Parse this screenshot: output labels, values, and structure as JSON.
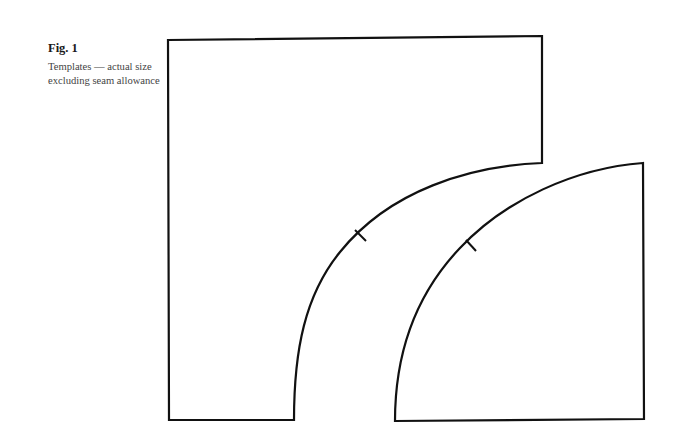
{
  "caption": {
    "label": "Fig. 1",
    "description": "Templates — actual size excluding seam allowance"
  },
  "templates": [
    {
      "name": "outer-template",
      "path": "M168,40 L542,36 L542,163 C470,166 390,190 340,252 C305,295 294,350 294,420 L169,420 Z",
      "notch": {
        "x1": 355,
        "y1": 230,
        "x2": 366,
        "y2": 241
      }
    },
    {
      "name": "quarter-circle-template",
      "path": "M643,163 L644,419 L395,421 C395,345 420,290 460,248 C505,200 575,168 643,163 Z",
      "notch": {
        "x1": 466,
        "y1": 240,
        "x2": 476,
        "y2": 251
      }
    }
  ],
  "colors": {
    "stroke": "#111111",
    "background": "#ffffff"
  }
}
